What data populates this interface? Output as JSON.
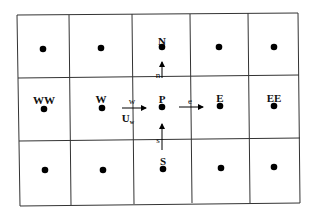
{
  "diagram": {
    "title": "",
    "grid": {
      "rows": 3,
      "cols": 5
    },
    "nodes": {
      "N": "N",
      "W": "W",
      "WW": "WW",
      "P": "P",
      "E": "E",
      "EE": "EE",
      "S": "S"
    },
    "faces": {
      "w": "w",
      "e": "e",
      "n": "n",
      "s": "s"
    },
    "velocity_label": "U",
    "velocity_subscript": "w",
    "colors": {
      "line": "#333333",
      "dot": "#000000",
      "background": "#ffffff"
    }
  }
}
